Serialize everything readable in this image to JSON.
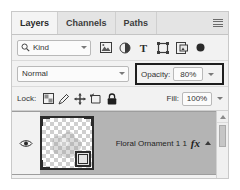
{
  "panel": {
    "name": "Layers panel",
    "tabs": [
      {
        "label": "Layers",
        "active": true
      },
      {
        "label": "Channels",
        "active": false
      },
      {
        "label": "Paths",
        "active": false
      }
    ],
    "menu_icon": "panel-menu-icon"
  },
  "filter": {
    "kind_label": "Kind",
    "search_icon": "search-icon",
    "dropdown_icon": "chevron-down-icon",
    "type_filters": [
      {
        "icon": "pixel-layer-icon",
        "label": "Filter for pixel layers"
      },
      {
        "icon": "adjustment-layer-icon",
        "label": "Filter for adjustment layers"
      },
      {
        "icon": "type-layer-icon",
        "label": "Filter for type layers"
      },
      {
        "icon": "shape-layer-icon",
        "label": "Filter for shape layers"
      },
      {
        "icon": "smart-object-icon",
        "label": "Filter for smart objects"
      }
    ],
    "toggle_icon": "filter-toggle-icon"
  },
  "blend": {
    "mode": "Normal",
    "mode_dropdown_icon": "chevron-down-icon",
    "opacity_label": "Opacity:",
    "opacity_value": "80%",
    "opacity_dropdown_icon": "chevron-down-icon",
    "highlight_color": "#1e1e1e"
  },
  "lock": {
    "label": "Lock:",
    "buttons": [
      {
        "icon": "lock-transparent-pixels-icon",
        "label": "Lock transparent pixels"
      },
      {
        "icon": "lock-image-pixels-icon",
        "label": "Lock image pixels"
      },
      {
        "icon": "lock-position-icon",
        "label": "Lock position"
      },
      {
        "icon": "lock-artboard-nesting-icon",
        "label": "Prevent auto-nesting into artboards"
      },
      {
        "icon": "lock-all-icon",
        "label": "Lock all"
      }
    ],
    "fill_label": "Fill:",
    "fill_value": "100%",
    "fill_dropdown_icon": "chevron-down-icon"
  },
  "layers": [
    {
      "name": "Floral Ornament 1 1",
      "visible": true,
      "visibility_icon": "eye-icon",
      "thumbnail": "transparent-checkerboard-thumbnail",
      "effects_badge": "fx",
      "expand_icon": "chevron-up-icon",
      "selected": true
    }
  ],
  "scrollbar": {
    "up_arrow_icon": "scroll-up-arrow-icon",
    "thumb": "scroll-thumb"
  }
}
